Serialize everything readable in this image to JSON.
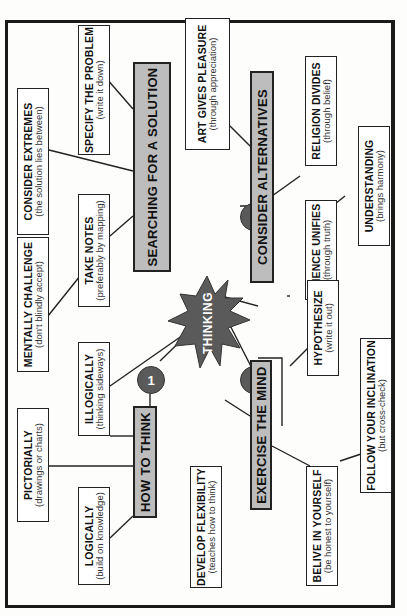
{
  "center": {
    "label": "THINKING",
    "shape": "starburst",
    "color": "#5a5a5a"
  },
  "branches": [
    {
      "number": "1",
      "header": "HOW TO THINK",
      "items": [
        {
          "title": "PICTORIALLY",
          "subtitle": "(drawings or charts)"
        },
        {
          "title": "ILLOGICALLY",
          "subtitle": "(thinking sideways)"
        },
        {
          "title": "LOGICALLY",
          "subtitle": "(build on knowledge)"
        }
      ]
    },
    {
      "number": "2",
      "header": "SEARCHING FOR A SOLUTION",
      "items": [
        {
          "title": "SPECIFY THE PROBLEM",
          "subtitle": "(write it down)"
        },
        {
          "title": "CONSIDER EXTREMES",
          "subtitle": "(the solution lies between)"
        },
        {
          "title": "TAKE NOTES",
          "subtitle": "(preferably by mapping)"
        },
        {
          "title": "MENTALLY CHALLENGE",
          "subtitle": "(don't blindly accept)"
        }
      ]
    },
    {
      "number": "3",
      "header": "CONSIDER ALTERNATIVES",
      "items": [
        {
          "title": "ART GIVES PLEASURE",
          "subtitle": "(through appreciation)"
        },
        {
          "title": "RELIGION DIVIDES",
          "subtitle": "(through belief)"
        },
        {
          "title": "SCIENCE UNIFIES",
          "subtitle": "(through truth)"
        },
        {
          "title": "UNDERSTANDING",
          "subtitle": "(brings harmony)"
        }
      ]
    },
    {
      "number": "4",
      "header": "EXERCISE THE MIND",
      "items": [
        {
          "title": "DEVELOP FLEXIBILITY",
          "subtitle": "(teaches how to think)"
        },
        {
          "title": "HYPOTHESIZE",
          "subtitle": "(write it out)"
        },
        {
          "title": "BELIVE IN YOURSELF",
          "subtitle": "(be honest to yourself)"
        },
        {
          "title": "FOLLOW YOUR INCLINATION",
          "subtitle": "(but cross-check)"
        }
      ]
    }
  ],
  "colors": {
    "header_fill": "#bdbdbd",
    "badge_fill": "#5a5a5a",
    "line": "#222222"
  }
}
